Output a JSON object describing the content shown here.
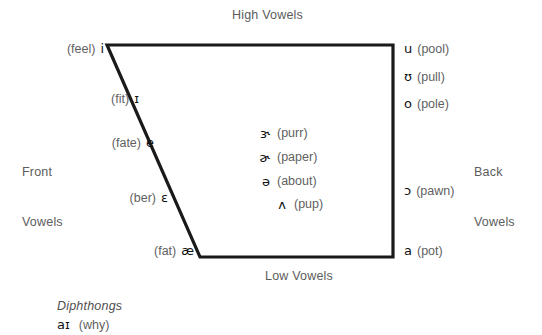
{
  "diagram": {
    "title_top": "High Vowels",
    "title_bottom": "Low Vowels",
    "left_axis_line1": "Front",
    "left_axis_line2": "Vowels",
    "right_axis_line1": "Back",
    "right_axis_line2": "Vowels",
    "stroke_color": "#1a1a1a",
    "background_color": "#ffffff"
  },
  "front_vowels": [
    {
      "word": "(feel)",
      "symbol": "i"
    },
    {
      "word": "(fit)",
      "symbol": "ɪ"
    },
    {
      "word": "(fate)",
      "symbol": "e"
    },
    {
      "word": "(ber)",
      "symbol": "ɛ"
    },
    {
      "word": "(fat)",
      "symbol": "æ"
    }
  ],
  "back_vowels": [
    {
      "symbol": "u",
      "word": "(pool)"
    },
    {
      "symbol": "ʊ",
      "word": "(pull)"
    },
    {
      "symbol": "o",
      "word": "(pole)"
    },
    {
      "symbol": "ɔ",
      "word": "(pawn)"
    },
    {
      "symbol": "a",
      "word": "(pot)"
    }
  ],
  "central_vowels": [
    {
      "symbol": "ɝ",
      "word": "(purr)"
    },
    {
      "symbol": "ɚ",
      "word": "(paper)"
    },
    {
      "symbol": "ə",
      "word": "(about)"
    },
    {
      "symbol": "ʌ",
      "word": "(pup)"
    }
  ],
  "diphthongs": {
    "heading": "Diphthongs",
    "items": [
      {
        "symbol": "aɪ",
        "word": "(why)"
      }
    ]
  }
}
